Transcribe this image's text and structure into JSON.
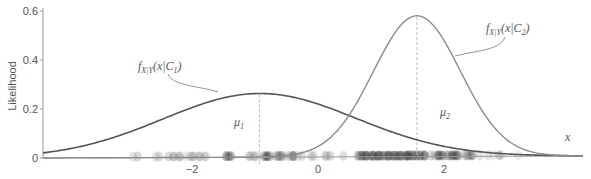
{
  "chart_data": {
    "type": "line",
    "title": "",
    "xlabel": "x",
    "ylabel": "Likelihood",
    "xlim": [
      -4.4,
      4.2
    ],
    "ylim": [
      0,
      0.6
    ],
    "x_ticks": [
      -2,
      0,
      2
    ],
    "x_tick_labels": [
      "−2",
      "0",
      "2"
    ],
    "y_ticks": [
      0,
      0.2,
      0.4,
      0.6
    ],
    "y_tick_labels": [
      "0",
      "0.2",
      "0.4",
      "0.6"
    ],
    "grid": false,
    "legend": null,
    "series": [
      {
        "name": "f_X|Y(x|C1)",
        "label_main": "f",
        "label_sub": "X|Y",
        "label_arg": "(x|C",
        "label_class_sub": "1",
        "label_close": ")",
        "distribution": "normal",
        "mean": -0.93,
        "std": 1.53,
        "peak": 0.26,
        "color": "#555555",
        "mean_label": "μ",
        "mean_label_sub": "1"
      },
      {
        "name": "f_X|Y(x|C2)",
        "label_main": "f",
        "label_sub": "X|Y",
        "label_arg": "(x|C",
        "label_class_sub": "2",
        "label_close": ")",
        "distribution": "normal",
        "mean": 1.57,
        "std": 0.69,
        "peak": 0.575,
        "color": "#8a8a8a",
        "mean_label": "μ",
        "mean_label_sub": "2"
      }
    ],
    "samples_on_axis": {
      "description": "1-D data samples plotted as translucent dots along the x-axis",
      "x_range": [
        -4.0,
        3.3
      ],
      "color": "#000000"
    },
    "annotations": [
      {
        "text": "μ1",
        "x": -0.93,
        "type": "dashed-vline"
      },
      {
        "text": "μ2",
        "x": 1.57,
        "type": "dashed-vline"
      }
    ]
  },
  "axes": {
    "y_label": "Likelihood",
    "x_label": "x"
  }
}
